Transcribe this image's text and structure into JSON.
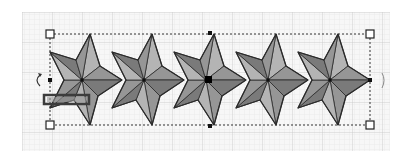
{
  "canvas": {
    "width": 420,
    "height": 158,
    "grid": {
      "x": 22,
      "y": 12,
      "width": 368,
      "height": 139,
      "minor": 5,
      "major": 30,
      "minor_color": "#e4e4e4",
      "major_color": "#c8c8c8",
      "bg": "#f6f6f6"
    }
  },
  "shape": {
    "name": "star-row",
    "star_count": 5,
    "star_centers_x": [
      82,
      144,
      206,
      268,
      330
    ],
    "center_y": 80,
    "colors": {
      "dark": "#7a7a7a",
      "mid": "#969696",
      "light": "#b4b4b4",
      "outline": "#2a2a2a"
    }
  },
  "selection": {
    "x1": 50,
    "y1": 34,
    "x2": 370,
    "y2": 125,
    "corner_handles": [
      "top-left",
      "top-right",
      "bottom-left",
      "bottom-right"
    ],
    "center_point": {
      "x": 208,
      "y": 79
    },
    "top_mid_point": {
      "x": 210,
      "y": 34
    },
    "bottom_mid_point": {
      "x": 210,
      "y": 126
    },
    "left_mid_point": {
      "x": 50,
      "y": 80
    }
  },
  "icons": {
    "rotate_left": "rotate-arrow-icon",
    "rotate_right": "rotate-arrow-icon",
    "skew_bar": "skew-handle-icon"
  }
}
